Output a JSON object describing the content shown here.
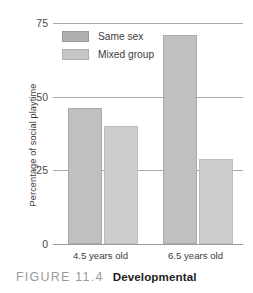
{
  "chart_data": {
    "type": "bar",
    "title": "",
    "xlabel": "",
    "ylabel": "Percentage of social playtime",
    "ylim": [
      0,
      75
    ],
    "yticks": [
      0,
      25,
      50,
      75
    ],
    "ytick_labels": [
      "0",
      "25",
      "50",
      "75"
    ],
    "grid": true,
    "legend_position": "upper-left-inside",
    "categories": [
      "4.5 years old",
      "6.5 years old"
    ],
    "series": [
      {
        "name": "Same sex",
        "color": "#c0c0c0",
        "values": [
          46,
          71
        ]
      },
      {
        "name": "Mixed group",
        "color": "#cdcdcd",
        "values": [
          40,
          29
        ]
      }
    ]
  },
  "caption": {
    "figure_number": "FIGURE 11.4",
    "title": "Developmental"
  },
  "colors": {
    "same_sex_bar": "#c0c0c0",
    "mixed_group_bar": "#cdcdcd",
    "gridline": "#a9a9a9",
    "text": "#3c3c3c",
    "caption_number": "#9a9a9a"
  }
}
